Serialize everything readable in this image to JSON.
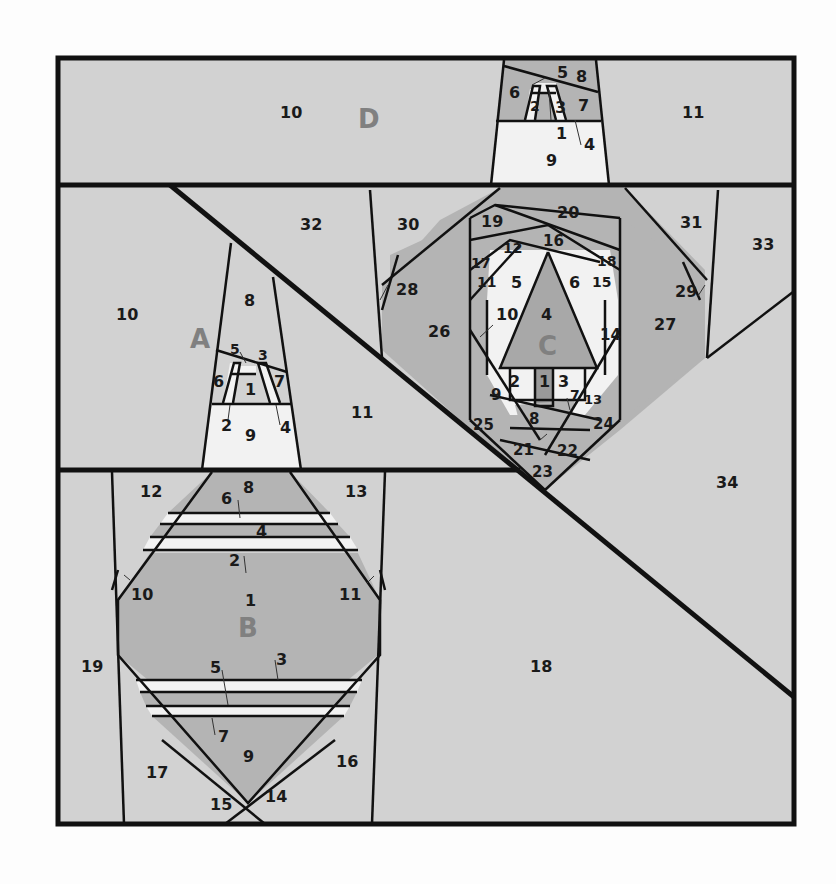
{
  "diagram": {
    "colors": {
      "background": "#fdfdfd",
      "light_gray": "#d2d2d2",
      "medium_gray": "#b4b4b4",
      "dark_gray": "#9a9a9a",
      "white_fill": "#f2f2f2",
      "outline": "#111111",
      "section_letter": "#808080"
    },
    "sections": {
      "A": {
        "letter": "A",
        "pieces": [
          "1",
          "2",
          "3",
          "4",
          "5",
          "6",
          "7",
          "8",
          "9",
          "10",
          "11"
        ]
      },
      "B": {
        "letter": "B",
        "pieces": [
          "1",
          "2",
          "3",
          "4",
          "5",
          "6",
          "7",
          "8",
          "9",
          "10",
          "11",
          "12",
          "13",
          "14",
          "15",
          "16",
          "17",
          "18",
          "19"
        ]
      },
      "C": {
        "letter": "C",
        "pieces": [
          "1",
          "2",
          "3",
          "4",
          "5",
          "6",
          "7",
          "8",
          "9",
          "10",
          "11",
          "12",
          "13",
          "14",
          "15",
          "16",
          "17",
          "18",
          "19",
          "20",
          "21",
          "22",
          "23",
          "24",
          "25",
          "26",
          "27",
          "28",
          "29",
          "30",
          "31",
          "32",
          "33",
          "34"
        ]
      },
      "D": {
        "letter": "D",
        "pieces": [
          "1",
          "2",
          "3",
          "4",
          "5",
          "6",
          "7",
          "8",
          "9",
          "10",
          "11"
        ]
      }
    }
  }
}
